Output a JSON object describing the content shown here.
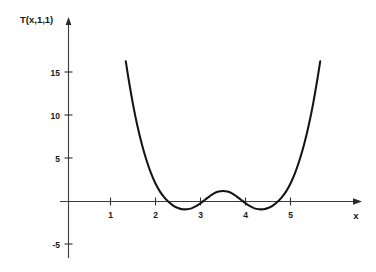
{
  "figure": {
    "background_color": "#ffffff",
    "curve_color": "#141414",
    "axis_color": "#3a3a3a",
    "y_axis_title": "T(x,1,1)",
    "x_axis_title": "x"
  },
  "chart_data": {
    "type": "line",
    "title": "",
    "subtitle": "",
    "xlabel": "x",
    "ylabel": "T(x,1,1)",
    "xlim": [
      0.0,
      6.5
    ],
    "ylim": [
      -6.5,
      18.0
    ],
    "grid": false,
    "legend": null,
    "x_ticks": [
      1,
      2,
      3,
      4,
      5
    ],
    "x_tick_labels": [
      "1",
      "2",
      "3",
      "4",
      "5"
    ],
    "y_ticks": [
      -5,
      5,
      10,
      15
    ],
    "y_tick_labels": [
      "-5",
      "5",
      "10",
      "15"
    ],
    "axis_arrows": [
      "x-right",
      "y-up"
    ],
    "series": [
      {
        "name": "T(x,1,1)",
        "color": "#141414",
        "x": [
          1.34,
          1.4,
          1.5,
          1.6,
          1.7,
          1.8,
          1.9,
          2.0,
          2.1,
          2.2,
          2.3,
          2.4,
          2.5,
          2.6,
          2.7,
          2.8,
          2.9,
          3.0,
          3.1,
          3.2,
          3.3,
          3.4,
          3.5,
          3.6,
          3.7,
          3.8,
          3.9,
          4.0,
          4.1,
          4.2,
          4.3,
          4.4,
          4.5,
          4.6,
          4.7,
          4.8,
          4.9,
          5.0,
          5.1,
          5.2,
          5.3,
          5.4,
          5.5,
          5.6,
          5.66
        ],
        "y": [
          16.3,
          14.3,
          11.3,
          8.75,
          6.6,
          4.8,
          3.3,
          2.1,
          1.15,
          0.45,
          -0.1,
          -0.5,
          -0.75,
          -0.9,
          -0.9,
          -0.8,
          -0.55,
          -0.2,
          0.2,
          0.6,
          0.95,
          1.15,
          1.22,
          1.15,
          0.95,
          0.6,
          0.2,
          -0.2,
          -0.55,
          -0.8,
          -0.9,
          -0.9,
          -0.75,
          -0.5,
          -0.1,
          0.45,
          1.15,
          2.1,
          3.3,
          4.8,
          6.6,
          8.75,
          11.3,
          14.3,
          16.3
        ],
        "description": "Symmetric W-shaped curve about x=3.5; steep outer branches, two minima near x=2.65 and x=4.35, local maximum near x=3.5"
      }
    ],
    "annotations": []
  }
}
